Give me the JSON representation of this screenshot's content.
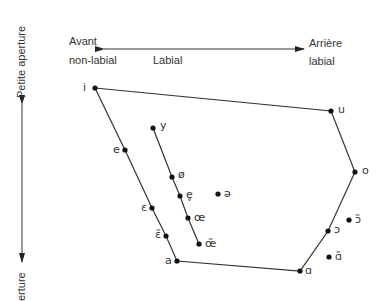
{
  "diagram": {
    "axis_labels": {
      "front": "Avant",
      "front_sub": "non-labial",
      "middle": "Labial",
      "back": "Arrière",
      "back_sub": "labial",
      "vertical_top": "Petite aperture",
      "vertical_bottom": "erture"
    },
    "points": [
      {
        "id": "i",
        "label": "i",
        "x": 95,
        "y": 88,
        "lx": 83,
        "ly": 82
      },
      {
        "id": "u",
        "label": "u",
        "x": 331,
        "y": 111,
        "lx": 338,
        "ly": 104
      },
      {
        "id": "o",
        "label": "o",
        "x": 355,
        "y": 172,
        "lx": 362,
        "ly": 165
      },
      {
        "id": "open-o",
        "label": "ɔ",
        "x": 328,
        "y": 231,
        "lx": 334,
        "ly": 224
      },
      {
        "id": "back-a",
        "label": "ɑ",
        "x": 300,
        "y": 271,
        "lx": 305,
        "ly": 265
      },
      {
        "id": "a",
        "label": "a",
        "x": 177,
        "y": 261,
        "lx": 165,
        "ly": 255
      },
      {
        "id": "nasal-epsilon",
        "label": "ɛ̃",
        "x": 166,
        "y": 236,
        "lx": 155,
        "ly": 229
      },
      {
        "id": "epsilon",
        "label": "ɛ",
        "x": 152,
        "y": 208,
        "lx": 141,
        "ly": 202
      },
      {
        "id": "e",
        "label": "e",
        "x": 125,
        "y": 150,
        "lx": 113,
        "ly": 144
      },
      {
        "id": "y",
        "label": "y",
        "x": 153,
        "y": 128,
        "lx": 160,
        "ly": 120
      },
      {
        "id": "o-slash",
        "label": "ø",
        "x": 172,
        "y": 177,
        "lx": 178,
        "ly": 169
      },
      {
        "id": "e-ring",
        "label": "e̥",
        "x": 180,
        "y": 196,
        "lx": 186,
        "ly": 189
      },
      {
        "id": "oe",
        "label": "œ",
        "x": 188,
        "y": 218,
        "lx": 194,
        "ly": 212
      },
      {
        "id": "nasal-oe",
        "label": "œ̃",
        "x": 199,
        "y": 244,
        "lx": 205,
        "ly": 238
      },
      {
        "id": "schwa",
        "label": "ə",
        "x": 218,
        "y": 194,
        "lx": 224,
        "ly": 188
      },
      {
        "id": "nasal-open-o",
        "label": "ɔ̃",
        "x": 349,
        "y": 220,
        "lx": 355,
        "ly": 214
      },
      {
        "id": "nasal-back-a",
        "label": "ɑ̃",
        "x": 329,
        "y": 257,
        "lx": 335,
        "ly": 251
      }
    ],
    "outline": [
      "i",
      "u",
      "o",
      "open-o",
      "back-a",
      "a",
      "nasal-epsilon",
      "epsilon",
      "e",
      "i"
    ],
    "inner_line": [
      "y",
      "o-slash",
      "e-ring",
      "oe",
      "nasal-oe",
      "back-a"
    ]
  }
}
